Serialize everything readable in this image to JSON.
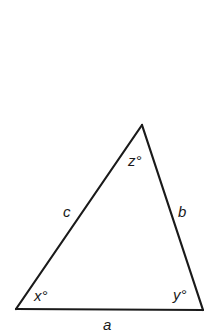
{
  "diagram": {
    "type": "triangle",
    "stroke_color": "#1a1a1a",
    "background": "#ffffff",
    "vertices": {
      "bottom_left": [
        16,
        309
      ],
      "bottom_right": [
        203,
        310
      ],
      "top": [
        142,
        125
      ]
    },
    "angles": {
      "bottom_left": "x°",
      "bottom_right": "y°",
      "top": "z°"
    },
    "sides": {
      "base": "a",
      "right": "b",
      "left": "c"
    }
  }
}
